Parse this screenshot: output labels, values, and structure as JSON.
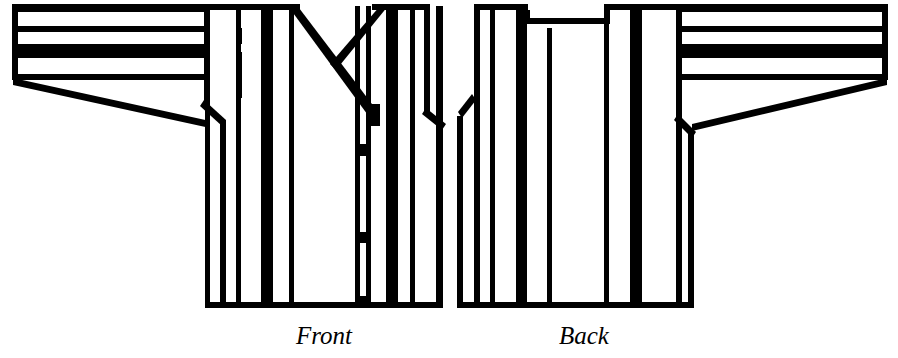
{
  "figure": {
    "garment_type": "kimono jacket",
    "views": [
      {
        "id": "front",
        "label": "Front",
        "label_style": "italic-serif",
        "features": [
          "v-neck overlapping collar",
          "center front placket",
          "three tie fasteners on placket",
          "wide tapered sleeve",
          "vertical body stripes",
          "horizontal sleeve stripes"
        ]
      },
      {
        "id": "back",
        "label": "Back",
        "label_style": "italic-serif",
        "features": [
          "shallow notched back neckline",
          "center back seam",
          "wide tapered sleeve",
          "vertical body stripes",
          "horizontal sleeve stripes"
        ]
      }
    ],
    "colors": {
      "ink": "#000000",
      "paper": "#ffffff"
    },
    "stripe_pattern": {
      "body_orientation": "vertical",
      "sleeve_orientation": "horizontal",
      "weights": [
        "thin",
        "thin",
        "thick",
        "thin"
      ]
    }
  },
  "captions": {
    "front": "Front",
    "back": "Back"
  }
}
